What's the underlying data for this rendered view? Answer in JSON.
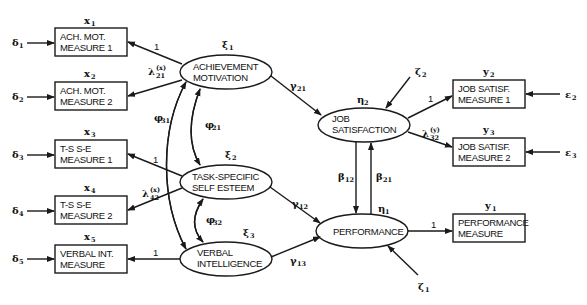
{
  "exogenous_latent": [
    {
      "id": "xi1",
      "symbol": "ξ",
      "sub": "1",
      "line1": "ACHIEVEMENT",
      "line2": "MOTIVATION"
    },
    {
      "id": "xi2",
      "symbol": "ξ",
      "sub": "2",
      "line1": "TASK-SPECIFIC",
      "line2": "SELF ESTEEM"
    },
    {
      "id": "xi3",
      "symbol": "ξ",
      "sub": "3",
      "line1": "VERBAL",
      "line2": "INTELLIGENCE"
    }
  ],
  "endogenous_latent": [
    {
      "id": "eta2",
      "symbol": "η",
      "sub": "2",
      "line1": "JOB",
      "line2": "SATISFACTION"
    },
    {
      "id": "eta1",
      "symbol": "η",
      "sub": "1",
      "line1": "PERFORMANCE",
      "line2": ""
    }
  ],
  "x_indicators": [
    {
      "label": "x",
      "sub": "1",
      "line1": "ACH. MOT.",
      "line2": "MEASURE 1",
      "error": "δ",
      "error_sub": "1",
      "loading": "1"
    },
    {
      "label": "x",
      "sub": "2",
      "line1": "ACH. MOT.",
      "line2": "MEASURE 2",
      "error": "δ",
      "error_sub": "2",
      "loading": "λ",
      "loading_sub": "21",
      "loading_sup": "(x)"
    },
    {
      "label": "x",
      "sub": "3",
      "line1": "T-S  S-E",
      "line2": "MEASURE 1",
      "error": "δ",
      "error_sub": "3",
      "loading": "1"
    },
    {
      "label": "x",
      "sub": "4",
      "line1": "T-S  S-E",
      "line2": "MEASURE 2",
      "error": "δ",
      "error_sub": "4",
      "loading": "λ",
      "loading_sub": "42",
      "loading_sup": "(x)"
    },
    {
      "label": "x",
      "sub": "5",
      "line1": "VERBAL INT.",
      "line2": "MEASURE",
      "error": "δ",
      "error_sub": "5",
      "loading": "1"
    }
  ],
  "y_indicators": [
    {
      "label": "y",
      "sub": "2",
      "line1": "JOB SATISF.",
      "line2": "MEASURE 1",
      "error": "ε",
      "error_sub": "2",
      "loading": "1"
    },
    {
      "label": "y",
      "sub": "3",
      "line1": "JOB SATISF.",
      "line2": "MEASURE 2",
      "error": "ε",
      "error_sub": "3",
      "loading": "λ",
      "loading_sub": "32",
      "loading_sup": "(y)"
    },
    {
      "label": "y",
      "sub": "1",
      "line1": "PERFORMANCE",
      "line2": "MEASURE",
      "loading": "1"
    }
  ],
  "paths": {
    "gamma21": {
      "symbol": "γ",
      "sub": "21"
    },
    "gamma12": {
      "symbol": "γ",
      "sub": "12"
    },
    "gamma13": {
      "symbol": "γ",
      "sub": "13"
    },
    "beta12": {
      "symbol": "β",
      "sub": "12"
    },
    "beta21": {
      "symbol": "β",
      "sub": "21"
    }
  },
  "covariances": {
    "phi21": {
      "symbol": "φ",
      "sub": "21"
    },
    "phi32": {
      "symbol": "φ",
      "sub": "32"
    },
    "phi31": {
      "symbol": "φ",
      "sub": "31"
    }
  },
  "disturbances": {
    "zeta2": {
      "symbol": "ζ",
      "sub": "2"
    },
    "zeta1": {
      "symbol": "ζ",
      "sub": "1"
    }
  }
}
